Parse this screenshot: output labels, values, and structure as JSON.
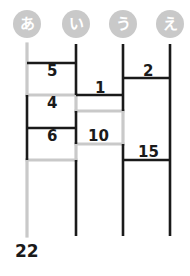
{
  "diagram": {
    "type": "amidakuji-ladder-lottery",
    "title": "",
    "colors": {
      "line": "#1a1a1a",
      "path_highlight": "#c9c9c9",
      "head_circle": "#c9c9c9",
      "head_text": "#ffffff",
      "number_text": "#1a1a1a",
      "background": "#ffffff"
    },
    "heads": [
      {
        "id": "head-a",
        "label": "あ",
        "x": 27
      },
      {
        "id": "head-i",
        "label": "い",
        "x": 76
      },
      {
        "id": "head-u",
        "label": "う",
        "x": 123
      },
      {
        "id": "head-e",
        "label": "え",
        "x": 170
      }
    ],
    "verticals": [
      {
        "id": "line-1",
        "x": 27,
        "top": 44,
        "bottom": 236
      },
      {
        "id": "line-2",
        "x": 76,
        "top": 44,
        "bottom": 236
      },
      {
        "id": "line-3",
        "x": 123,
        "top": 44,
        "bottom": 236
      },
      {
        "id": "line-4",
        "x": 170,
        "top": 44,
        "bottom": 236
      }
    ],
    "rungs": [
      {
        "id": "rung-5",
        "from": 27,
        "to": 76,
        "y": 63,
        "label": "5",
        "label_x": 47,
        "label_y": 72
      },
      {
        "id": "rung-2",
        "from": 123,
        "to": 170,
        "y": 78,
        "label": "2",
        "label_x": 143,
        "label_y": 72
      },
      {
        "id": "rung-1",
        "from": 76,
        "to": 123,
        "y": 95,
        "label": "1",
        "label_x": 95,
        "label_y": 89
      },
      {
        "id": "rung-4",
        "from": 27,
        "to": 76,
        "y": 95,
        "label": "4",
        "label_x": 47,
        "label_y": 105
      },
      {
        "id": "rung-10",
        "from": 76,
        "to": 123,
        "y": 128,
        "label": "10",
        "label_x": 89,
        "label_y": 122
      },
      {
        "id": "rung-15",
        "from": 123,
        "to": 170,
        "y": 160,
        "label": "15",
        "label_x": 139,
        "label_y": 154
      },
      {
        "id": "rung-6",
        "from": 27,
        "to": 76,
        "y": 128,
        "label": "6",
        "label_x": 47,
        "label_y": 138
      },
      {
        "id": "rung-bottom",
        "from": 27,
        "to": 76,
        "y": 160,
        "label": "",
        "label_x": 0,
        "label_y": 0
      }
    ],
    "result": {
      "id": "result-total",
      "label": "22",
      "x": 18,
      "y": 250
    },
    "highlight_path": {
      "start_head": "あ",
      "end_label": "22",
      "description": "traced route from head あ down and across to the total 22"
    }
  }
}
